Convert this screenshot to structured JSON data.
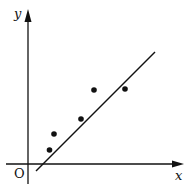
{
  "chart_data": {
    "type": "scatter",
    "title": "",
    "xlabel": "x",
    "ylabel": "y",
    "origin_label": "O",
    "units_note": "No tick labels shown; coordinates are approximate relative offsets from origin (pixel units, y upward)",
    "points": [
      {
        "x": 21.5,
        "y": 14
      },
      {
        "x": 26,
        "y": 30
      },
      {
        "x": 53,
        "y": 45
      },
      {
        "x": 66,
        "y": 74
      },
      {
        "x": 97,
        "y": 75
      }
    ],
    "fit_line": {
      "x1": 8,
      "y1": -7,
      "x2": 127,
      "y2": 112
    },
    "xlim": [
      -10,
      155
    ],
    "ylim": [
      -20,
      155
    ],
    "grid": false,
    "legend": null,
    "colors": {
      "ink": "#111111",
      "background": "#ffffff"
    }
  },
  "layout": {
    "origin_px": {
      "x": 28,
      "y": 164
    },
    "x_axis": {
      "start": 6,
      "end": 184
    },
    "y_axis": {
      "start": 184,
      "end": 9
    }
  }
}
